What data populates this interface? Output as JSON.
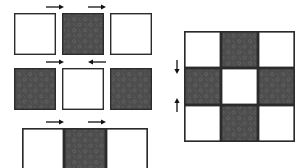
{
  "figure": {
    "colors": {
      "background": "#ffffff",
      "tile_light": "#ffffff",
      "tile_dark": "#4d4d4d",
      "tile_dark_pattern": "#5d5d5d",
      "outline": "#2b2b2b",
      "arrow": "#111111"
    },
    "geometry": {
      "tile_size": 42,
      "outline_width": 1.4
    }
  },
  "left_figure": {
    "name": "exploded-rows",
    "rows": [
      {
        "row_index": 1,
        "label": "top-row",
        "y": 13,
        "joined": false,
        "tiles": [
          {
            "index": 0,
            "fill": "light",
            "x": 14,
            "label": "top-left-tile"
          },
          {
            "index": 1,
            "fill": "dark",
            "x": 62,
            "label": "top-center-tile"
          },
          {
            "index": 2,
            "fill": "light",
            "x": 110,
            "label": "top-right-tile"
          }
        ],
        "arrows": [
          {
            "index": 0,
            "direction": "right",
            "x": 46,
            "y": 7,
            "length": 18,
            "label": "top-left-arrow"
          },
          {
            "index": 1,
            "direction": "right",
            "x": 88,
            "y": 7,
            "length": 18,
            "label": "top-right-arrow"
          }
        ]
      },
      {
        "row_index": 2,
        "label": "middle-row",
        "y": 68,
        "joined": false,
        "tiles": [
          {
            "index": 0,
            "fill": "dark",
            "x": 14,
            "label": "middle-left-tile"
          },
          {
            "index": 1,
            "fill": "light",
            "x": 62,
            "label": "middle-center-tile"
          },
          {
            "index": 2,
            "fill": "dark",
            "x": 110,
            "label": "middle-right-tile"
          }
        ],
        "arrows": [
          {
            "index": 0,
            "direction": "right",
            "x": 46,
            "y": 62,
            "length": 18,
            "label": "middle-left-arrow"
          },
          {
            "index": 1,
            "direction": "left",
            "x": 88,
            "y": 62,
            "length": 18,
            "label": "middle-right-arrow"
          }
        ]
      },
      {
        "row_index": 3,
        "label": "bottom-row",
        "y": 128,
        "joined": true,
        "tiles": [
          {
            "index": 0,
            "fill": "light",
            "x": 22,
            "label": "bottom-left-tile"
          },
          {
            "index": 1,
            "fill": "dark",
            "x": 64,
            "label": "bottom-center-tile"
          },
          {
            "index": 2,
            "fill": "light",
            "x": 106,
            "label": "bottom-right-tile"
          }
        ],
        "arrows": [
          {
            "index": 0,
            "direction": "right",
            "x": 46,
            "y": 122,
            "length": 18,
            "label": "bottom-left-arrow"
          },
          {
            "index": 1,
            "direction": "right",
            "x": 88,
            "y": 122,
            "length": 18,
            "label": "bottom-right-arrow"
          }
        ]
      }
    ]
  },
  "right_figure": {
    "name": "assembled-grid",
    "origin": {
      "x": 184,
      "y": 31
    },
    "tile_size": 37,
    "rows": 3,
    "cols": 3,
    "pattern": [
      [
        "light",
        "dark",
        "light"
      ],
      [
        "dark",
        "light",
        "dark"
      ],
      [
        "light",
        "dark",
        "light"
      ]
    ],
    "cells": [
      {
        "row": 0,
        "col": 0,
        "fill": "light",
        "label": "cell-r0-c0"
      },
      {
        "row": 0,
        "col": 1,
        "fill": "dark",
        "label": "cell-r0-c1"
      },
      {
        "row": 0,
        "col": 2,
        "fill": "light",
        "label": "cell-r0-c2"
      },
      {
        "row": 1,
        "col": 0,
        "fill": "dark",
        "label": "cell-r1-c0"
      },
      {
        "row": 1,
        "col": 1,
        "fill": "light",
        "label": "cell-r1-c1"
      },
      {
        "row": 1,
        "col": 2,
        "fill": "dark",
        "label": "cell-r1-c2"
      },
      {
        "row": 2,
        "col": 0,
        "fill": "light",
        "label": "cell-r2-c0"
      },
      {
        "row": 2,
        "col": 1,
        "fill": "dark",
        "label": "cell-r2-c1"
      },
      {
        "row": 2,
        "col": 2,
        "fill": "light",
        "label": "cell-r2-c2"
      }
    ],
    "arrows": [
      {
        "index": 0,
        "direction": "down",
        "x": 177,
        "y": 60,
        "length": 14,
        "label": "grid-upper-arrow"
      },
      {
        "index": 1,
        "direction": "up",
        "x": 177,
        "y": 98,
        "length": 14,
        "label": "grid-lower-arrow"
      }
    ]
  }
}
